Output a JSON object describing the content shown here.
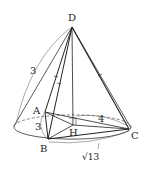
{
  "diagram": {
    "type": "geometry-cone-tetrahedron",
    "points": {
      "D": {
        "label": "D",
        "x": 72,
        "y": 27
      },
      "A": {
        "label": "A",
        "x": 45,
        "y": 112
      },
      "B": {
        "label": "B",
        "x": 48,
        "y": 139
      },
      "C": {
        "label": "C",
        "x": 129,
        "y": 129
      },
      "H": {
        "label": "H",
        "x": 73,
        "y": 125
      }
    },
    "measurements": {
      "slant": "3",
      "ab": "3",
      "hc": "4",
      "bc": "√13"
    },
    "colors": {
      "stroke": "#222222",
      "thin": "#555555"
    }
  }
}
